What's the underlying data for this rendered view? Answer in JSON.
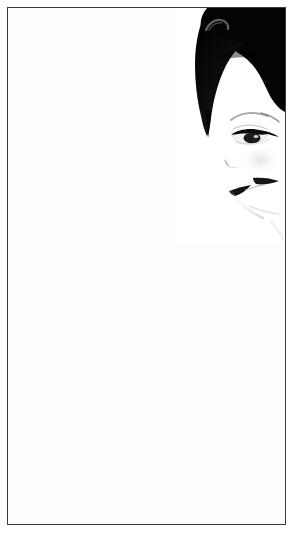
{
  "artwork": {
    "title": "",
    "caption": "",
    "medium_note": "",
    "subject_name": "high-contrast female portrait",
    "orientation": "portrait",
    "width_px": 295,
    "height_px": 533
  },
  "colors": {
    "background": "#ffffff",
    "paper": "#fefefe",
    "frame_border": "#3a3a3c",
    "ink_black": "#000000",
    "hair_black": "#050505",
    "hair_highlight": "#4a4a4a",
    "soft_gray": "#b8b8b8",
    "faint_gray": "#dedede",
    "lash_black": "#111111",
    "lip_black": "#1a1a1a"
  },
  "frame": {
    "label": "picture-frame",
    "inset_left": 7,
    "inset_top": 7,
    "stroke_width": 1.5
  },
  "portrait": {
    "label": "portrait-subject",
    "placement": "upper-right",
    "features": [
      {
        "name": "hair-mass",
        "label": "black hair"
      },
      {
        "name": "hair-highlight",
        "label": "hair highlight"
      },
      {
        "name": "eyebrow",
        "label": "eyebrow"
      },
      {
        "name": "eye",
        "label": "downcast eye"
      },
      {
        "name": "eyelash-line",
        "label": "upper lash line"
      },
      {
        "name": "iris",
        "label": "iris"
      },
      {
        "name": "nostril",
        "label": "nostril"
      },
      {
        "name": "upper-lip",
        "label": "upper lip"
      },
      {
        "name": "lower-lip",
        "label": "lower lip"
      },
      {
        "name": "jawline",
        "label": "jaw contour"
      },
      {
        "name": "cheek-shadow",
        "label": "cheek shadow"
      }
    ]
  },
  "negative_space": {
    "label": "white-field",
    "description": "large empty white area"
  }
}
